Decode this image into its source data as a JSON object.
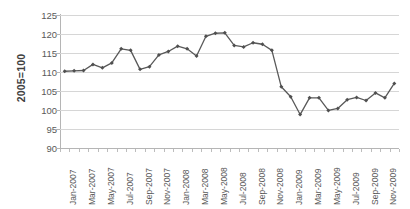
{
  "chart_data": {
    "type": "line",
    "title": "",
    "xlabel": "",
    "ylabel": "2005=100",
    "ylim": [
      90,
      125
    ],
    "y_ticks": [
      90,
      95,
      100,
      105,
      110,
      115,
      120,
      125
    ],
    "grid": true,
    "legend": "none",
    "marker": "diamond",
    "line_color": "#595959",
    "marker_color": "#4f4f4f",
    "gridline_color": "#d6d6d6",
    "axis_color": "#b5b5b5",
    "x_tick_labels": [
      "Jan-2007",
      "Mar-2007",
      "May-2007",
      "Jul-2007",
      "Sep-2007",
      "Nov-2007",
      "Jan-2008",
      "Mar-2008",
      "May-2008",
      "Jul-2008",
      "Sep-2008",
      "Nov-2008",
      "Jan-2009",
      "Mar-2009",
      "May-2009",
      "Jul-2009",
      "Sep-2009",
      "Nov-2009"
    ],
    "x": [
      "Jan-2007",
      "Feb-2007",
      "Mar-2007",
      "Apr-2007",
      "May-2007",
      "Jun-2007",
      "Jul-2007",
      "Aug-2007",
      "Sep-2007",
      "Oct-2007",
      "Nov-2007",
      "Dec-2007",
      "Jan-2008",
      "Feb-2008",
      "Mar-2008",
      "Apr-2008",
      "May-2008",
      "Jun-2008",
      "Jul-2008",
      "Aug-2008",
      "Sep-2008",
      "Oct-2008",
      "Nov-2008",
      "Dec-2008",
      "Jan-2009",
      "Feb-2009",
      "Mar-2009",
      "Apr-2009",
      "May-2009",
      "Jun-2009",
      "Jul-2009",
      "Aug-2009",
      "Sep-2009",
      "Oct-2009",
      "Nov-2009",
      "Dec-2009"
    ],
    "values": [
      110.2,
      110.3,
      110.4,
      112.0,
      111.1,
      112.4,
      116.1,
      115.7,
      110.7,
      111.4,
      114.5,
      115.4,
      116.8,
      116.1,
      114.2,
      119.4,
      120.2,
      120.3,
      117.0,
      116.6,
      117.7,
      117.3,
      115.7,
      106.1,
      103.5,
      98.8,
      103.2,
      103.2,
      99.9,
      100.4,
      102.7,
      103.3,
      102.5,
      104.5,
      103.2,
      107.0
    ]
  }
}
